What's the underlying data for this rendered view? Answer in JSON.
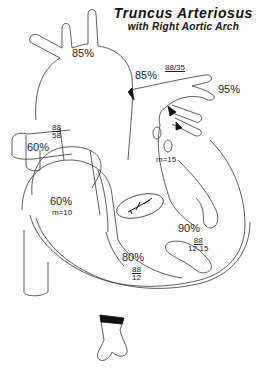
{
  "title": {
    "main": "Truncus Arteriosus",
    "sub": "with Right Aortic Arch"
  },
  "labels": {
    "aorta_sat": "85%",
    "pa_sat": "85%",
    "pa_pressure": "88/35",
    "pulm_vein_sat": "95%",
    "svc_sat": "60%",
    "truncus_pressure_sys": "88",
    "truncus_pressure_dia": "58",
    "ra_sat": "60%",
    "ra_mean": "m=10",
    "la_mean": "m=15",
    "lv_sat": "90%",
    "lv_pressure_sys": "88",
    "lv_pressure_dia": "12-15",
    "rv_sat": "80%",
    "rv_pressure_sys": "88",
    "rv_pressure_dia": "12"
  },
  "colors": {
    "line": "#333333",
    "fill_dark": "#111111",
    "background": "#ffffff"
  }
}
